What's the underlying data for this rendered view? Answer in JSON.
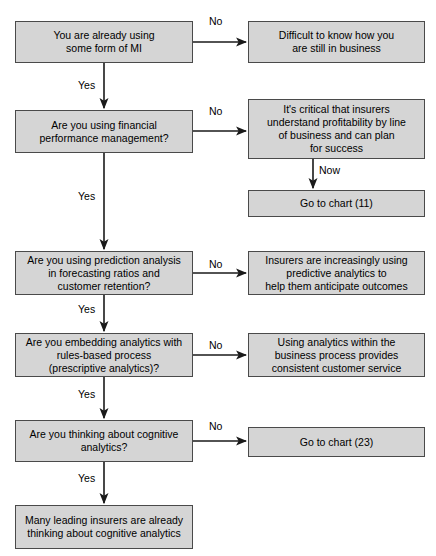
{
  "diagram": {
    "colors": {
      "node_fill": "#d5d5d5",
      "node_border": "#4a4a4a",
      "connector": "#1a1a1a",
      "background": "#ffffff",
      "text": "#000000"
    },
    "nodes": [
      {
        "id": "q1",
        "name": "node-already-using-mi",
        "text": "You are already using\nsome form of MI",
        "x": 15,
        "y": 21,
        "w": 178,
        "h": 42
      },
      {
        "id": "a1",
        "name": "node-difficult-to-know",
        "text": "Difficult to know how you\nare still in business",
        "x": 248,
        "y": 21,
        "w": 177,
        "h": 42
      },
      {
        "id": "q2",
        "name": "node-financial-performance-management",
        "text": "Are you using financial\nperformance management?",
        "x": 15,
        "y": 110,
        "w": 178,
        "h": 43
      },
      {
        "id": "a2",
        "name": "node-critical-insurers-profitability",
        "text": "It's critical that insurers\nunderstand profitability by line\nof business and can plan\nfor success",
        "x": 248,
        "y": 99,
        "w": 177,
        "h": 60
      },
      {
        "id": "a2b",
        "name": "node-go-to-chart-11",
        "text": "Go to chart (11)",
        "x": 248,
        "y": 190,
        "w": 177,
        "h": 27
      },
      {
        "id": "q3",
        "name": "node-prediction-analysis-forecasting",
        "text": "Are you using prediction analysis\nin forecasting ratios and\ncustomer retention?",
        "x": 15,
        "y": 251,
        "w": 178,
        "h": 44
      },
      {
        "id": "a3",
        "name": "node-insurers-predictive-analytics",
        "text": "Insurers are increasingly using\npredictive analytics to\nhelp them anticipate outcomes",
        "x": 248,
        "y": 251,
        "w": 177,
        "h": 44
      },
      {
        "id": "q4",
        "name": "node-embedding-analytics-rules-based",
        "text": "Are you embedding analytics with\nrules-based process\n(prescriptive analytics)?",
        "x": 15,
        "y": 333,
        "w": 178,
        "h": 44
      },
      {
        "id": "a4",
        "name": "node-analytics-within-business-process",
        "text": "Using analytics within the\nbusiness process provides\nconsistent customer service",
        "x": 248,
        "y": 333,
        "w": 177,
        "h": 44
      },
      {
        "id": "q5",
        "name": "node-thinking-about-cognitive-analytics",
        "text": "Are you thinking about cognitive\nanalytics?",
        "x": 15,
        "y": 420,
        "w": 178,
        "h": 42
      },
      {
        "id": "a5",
        "name": "node-go-to-chart-23",
        "text": "Go to chart (23)",
        "x": 248,
        "y": 427,
        "w": 177,
        "h": 30
      },
      {
        "id": "a6",
        "name": "node-many-leading-insurers",
        "text": "Many leading insurers are already\nthinking about cognitive analytics",
        "x": 15,
        "y": 505,
        "w": 178,
        "h": 44
      }
    ],
    "edge_labels": [
      {
        "id": "no1",
        "name": "edge-label-no-1",
        "text": "No",
        "x": 209,
        "y": 15
      },
      {
        "id": "yes1",
        "name": "edge-label-yes-1",
        "text": "Yes",
        "x": 78,
        "y": 79
      },
      {
        "id": "no2",
        "name": "edge-label-no-2",
        "text": "No",
        "x": 209,
        "y": 105
      },
      {
        "id": "now1",
        "name": "edge-label-now-1",
        "text": "Now",
        "x": 319,
        "y": 164
      },
      {
        "id": "yes2",
        "name": "edge-label-yes-2",
        "text": "Yes",
        "x": 78,
        "y": 190
      },
      {
        "id": "no3",
        "name": "edge-label-no-3",
        "text": "No",
        "x": 209,
        "y": 258
      },
      {
        "id": "yes3",
        "name": "edge-label-yes-3",
        "text": "Yes",
        "x": 78,
        "y": 303
      },
      {
        "id": "no4",
        "name": "edge-label-no-4",
        "text": "No",
        "x": 209,
        "y": 339
      },
      {
        "id": "yes4",
        "name": "edge-label-yes-4",
        "text": "Yes",
        "x": 78,
        "y": 388
      },
      {
        "id": "no5",
        "name": "edge-label-no-5",
        "text": "No",
        "x": 209,
        "y": 420
      },
      {
        "id": "yes5",
        "name": "edge-label-yes-5",
        "text": "Yes",
        "x": 78,
        "y": 472
      }
    ],
    "connectors": [
      {
        "id": "c1",
        "name": "connector-q1-to-a1",
        "kind": "horizontal",
        "x1": 193,
        "y1": 42,
        "x2": 246,
        "y2": 42
      },
      {
        "id": "c2",
        "name": "connector-q1-to-q2",
        "kind": "vertical",
        "x1": 104,
        "y1": 63,
        "x2": 104,
        "y2": 108
      },
      {
        "id": "c3",
        "name": "connector-q2-to-a2",
        "kind": "horizontal",
        "x1": 193,
        "y1": 131,
        "x2": 246,
        "y2": 131
      },
      {
        "id": "c4",
        "name": "connector-a2-to-a2b",
        "kind": "vertical",
        "x1": 313,
        "y1": 159,
        "x2": 313,
        "y2": 188
      },
      {
        "id": "c5",
        "name": "connector-q2-to-q3",
        "kind": "vertical",
        "x1": 104,
        "y1": 153,
        "x2": 104,
        "y2": 249
      },
      {
        "id": "c6",
        "name": "connector-q3-to-a3",
        "kind": "horizontal",
        "x1": 193,
        "y1": 273,
        "x2": 246,
        "y2": 273
      },
      {
        "id": "c7",
        "name": "connector-q3-to-q4",
        "kind": "vertical",
        "x1": 104,
        "y1": 295,
        "x2": 104,
        "y2": 331
      },
      {
        "id": "c8",
        "name": "connector-q4-to-a4",
        "kind": "horizontal",
        "x1": 193,
        "y1": 355,
        "x2": 246,
        "y2": 355
      },
      {
        "id": "c9",
        "name": "connector-q4-to-q5",
        "kind": "vertical",
        "x1": 104,
        "y1": 377,
        "x2": 104,
        "y2": 418
      },
      {
        "id": "c10",
        "name": "connector-q5-to-a5",
        "kind": "horizontal",
        "x1": 193,
        "y1": 441,
        "x2": 246,
        "y2": 441
      },
      {
        "id": "c11",
        "name": "connector-q5-to-a6",
        "kind": "vertical",
        "x1": 104,
        "y1": 462,
        "x2": 104,
        "y2": 503
      }
    ]
  }
}
